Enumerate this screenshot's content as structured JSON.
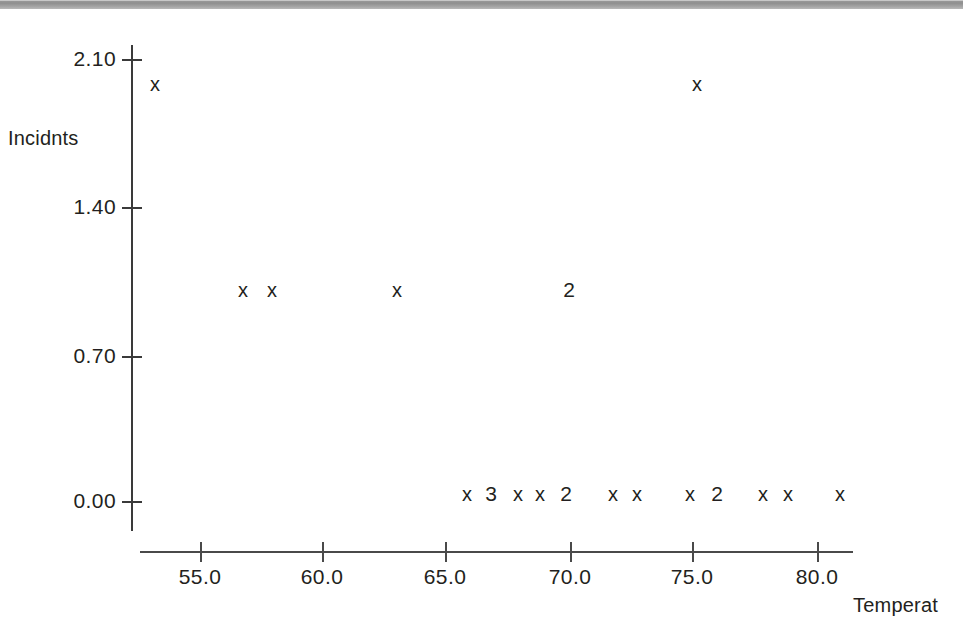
{
  "figure": {
    "background_color": "#ffffff",
    "ink_color": "#231f20",
    "top_band_color": "#9d9d9d"
  },
  "axes": {
    "y_title": "Incidnts",
    "x_title": "Temperat",
    "y_ticks": [
      {
        "label": "2.10",
        "value": 2.1,
        "px_y": 59
      },
      {
        "label": "1.40",
        "value": 1.4,
        "px_y": 207
      },
      {
        "label": "0.70",
        "value": 0.7,
        "px_y": 356
      },
      {
        "label": "0.00",
        "value": 0.0,
        "px_y": 501
      }
    ],
    "x_ticks": [
      {
        "label": "55.0",
        "value": 55.0,
        "px_x": 200
      },
      {
        "label": "60.0",
        "value": 60.0,
        "px_x": 322
      },
      {
        "label": "65.0",
        "value": 65.0,
        "px_x": 445
      },
      {
        "label": "70.0",
        "value": 70.0,
        "px_x": 570
      },
      {
        "label": "75.0",
        "value": 75.0,
        "px_x": 692
      },
      {
        "label": "80.0",
        "value": 80.0,
        "px_x": 817
      }
    ]
  },
  "chart_data": {
    "type": "scatter",
    "title": "",
    "xlabel": "Temperat",
    "ylabel": "Incidnts",
    "xlim": [
      53,
      82
    ],
    "ylim": [
      0.0,
      2.1
    ],
    "grid": false,
    "legend": null,
    "marker_glyph": "x",
    "overplot_note": "Digits replace the x glyph and indicate the number of coincident observations at that location.",
    "points": [
      {
        "x": 53.2,
        "y": 2.0,
        "glyph": "x",
        "count": 1,
        "px_x": 155,
        "px_y": 84
      },
      {
        "x": 75.2,
        "y": 2.0,
        "glyph": "x",
        "count": 1,
        "px_x": 697,
        "px_y": 84
      },
      {
        "x": 56.8,
        "y": 1.05,
        "glyph": "x",
        "count": 1,
        "px_x": 243,
        "px_y": 290
      },
      {
        "x": 57.9,
        "y": 1.05,
        "glyph": "x",
        "count": 1,
        "px_x": 272,
        "px_y": 290
      },
      {
        "x": 63.0,
        "y": 1.05,
        "glyph": "x",
        "count": 1,
        "px_x": 397,
        "px_y": 290
      },
      {
        "x": 70.0,
        "y": 1.05,
        "glyph": "2",
        "count": 2,
        "px_x": 569,
        "px_y": 290
      },
      {
        "x": 66.5,
        "y": 0.0,
        "glyph": "x",
        "count": 1,
        "px_x": 467,
        "px_y": 494
      },
      {
        "x": 67.4,
        "y": 0.0,
        "glyph": "3",
        "count": 3,
        "px_x": 491,
        "px_y": 494
      },
      {
        "x": 68.5,
        "y": 0.0,
        "glyph": "x",
        "count": 1,
        "px_x": 518,
        "px_y": 494
      },
      {
        "x": 69.4,
        "y": 0.0,
        "glyph": "x",
        "count": 1,
        "px_x": 540,
        "px_y": 494
      },
      {
        "x": 70.0,
        "y": 0.0,
        "glyph": "2",
        "count": 2,
        "px_x": 566,
        "px_y": 494
      },
      {
        "x": 72.3,
        "y": 0.0,
        "glyph": "x",
        "count": 1,
        "px_x": 613,
        "px_y": 494
      },
      {
        "x": 73.3,
        "y": 0.0,
        "glyph": "x",
        "count": 1,
        "px_x": 637,
        "px_y": 494
      },
      {
        "x": 75.4,
        "y": 0.0,
        "glyph": "x",
        "count": 1,
        "px_x": 690,
        "px_y": 494
      },
      {
        "x": 76.5,
        "y": 0.0,
        "glyph": "2",
        "count": 2,
        "px_x": 717,
        "px_y": 494
      },
      {
        "x": 78.3,
        "y": 0.0,
        "glyph": "x",
        "count": 1,
        "px_x": 763,
        "px_y": 494
      },
      {
        "x": 79.4,
        "y": 0.0,
        "glyph": "x",
        "count": 1,
        "px_x": 788,
        "px_y": 494
      },
      {
        "x": 81.5,
        "y": 0.0,
        "glyph": "x",
        "count": 1,
        "px_x": 840,
        "px_y": 494
      }
    ]
  }
}
